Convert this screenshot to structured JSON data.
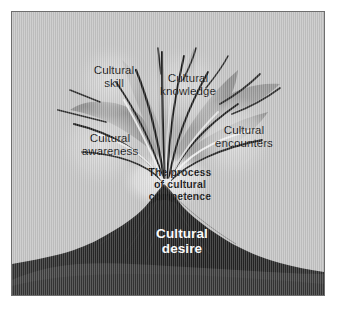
{
  "figure": {
    "kind": "conceptual-diagram",
    "frame_color": "#6e6e6e",
    "background_color": "#c4c4c4",
    "volcano_color": "#272727",
    "volcano_base_color": "#3b3b3b",
    "plume_color": "#9d9d9d",
    "label_text_color": "#141414",
    "desire_text_color": "#ffffff"
  },
  "labels": {
    "cultural_skill": {
      "line1": "Cultural",
      "line2": "skill"
    },
    "cultural_knowledge": {
      "line1": "Cultural",
      "line2": "knowledge"
    },
    "cultural_awareness": {
      "line1": "Cultural",
      "line2": "awareness"
    },
    "cultural_encounters": {
      "line1": "Cultural",
      "line2": "encounters"
    },
    "core_process": {
      "line1": "The process",
      "line2": "of cultural",
      "line3": "competence"
    },
    "cultural_desire": {
      "line1": "Cultural",
      "line2": "desire"
    }
  }
}
